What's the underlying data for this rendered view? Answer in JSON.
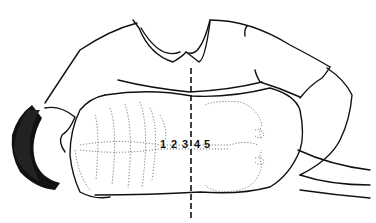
{
  "figure": {
    "vertebra_labels": [
      {
        "text": "1",
        "x": 163
      },
      {
        "text": "2",
        "x": 174
      },
      {
        "text": "3",
        "x": 185
      },
      {
        "text": "4",
        "x": 196
      },
      {
        "text": "5",
        "x": 206
      }
    ],
    "midline": {
      "style": "dashed",
      "x": 191,
      "y_start": 68,
      "y_end": 218
    },
    "colors": {
      "ink": "#111111",
      "dotted": "#555555",
      "background": "#ffffff"
    }
  }
}
